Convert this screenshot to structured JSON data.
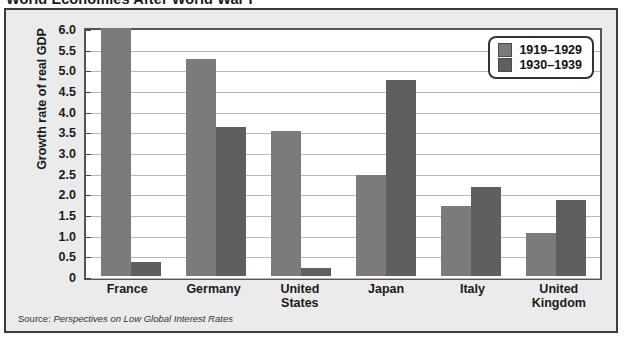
{
  "title": "World Economies After World War I",
  "source": {
    "prefix": "Source:",
    "reference": "Perspectives on Low Global Interest Rates"
  },
  "legend": {
    "series": [
      {
        "label": "1919–1929",
        "color": "#7b7b7b"
      },
      {
        "label": "1930–1939",
        "color": "#5f5f5f"
      }
    ]
  },
  "axis": {
    "ylabel": "Growth rate of real GDP",
    "yticks": [
      "6.0",
      "5.5",
      "5.0",
      "4.5",
      "4.0",
      "3.5",
      "3.0",
      "2.5",
      "2.0",
      "1.5",
      "1.0",
      "0.5",
      "0"
    ]
  },
  "chart_data": {
    "type": "bar",
    "title": "World Economies After World War I",
    "xlabel": "",
    "ylabel": "Growth rate of real GDP",
    "ylim": [
      0,
      6.0
    ],
    "ytick_step": 0.5,
    "grid": true,
    "legend_position": "top-right",
    "categories": [
      "France",
      "Germany",
      "United States",
      "Japan",
      "Italy",
      "United Kingdom"
    ],
    "category_lines": [
      [
        "France"
      ],
      [
        "Germany"
      ],
      [
        "United",
        "States"
      ],
      [
        "Japan"
      ],
      [
        "Italy"
      ],
      [
        "United",
        "Kingdom"
      ]
    ],
    "series": [
      {
        "name": "1919–1929",
        "color": "#7b7b7b",
        "values": [
          6.0,
          5.25,
          3.5,
          2.45,
          1.7,
          1.05
        ]
      },
      {
        "name": "1930–1939",
        "color": "#5f5f5f",
        "values": [
          0.35,
          3.6,
          0.2,
          4.75,
          2.15,
          1.85
        ]
      }
    ],
    "source": "Perspectives on Low Global Interest Rates"
  }
}
